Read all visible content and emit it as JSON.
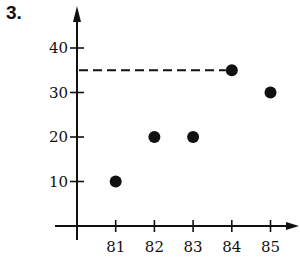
{
  "problem_number": "3.",
  "chart_data": {
    "type": "scatter",
    "title": "",
    "xlabel": "",
    "ylabel": "",
    "x": [
      81,
      82,
      83,
      84,
      85
    ],
    "y": [
      10,
      20,
      20,
      35,
      30
    ],
    "x_ticks": [
      "81",
      "82",
      "83",
      "84",
      "85"
    ],
    "y_ticks": [
      "10",
      "20",
      "30",
      "40"
    ],
    "xlim": [
      80,
      86
    ],
    "ylim": [
      0,
      45
    ],
    "grid": false,
    "legend": null,
    "annotations": [
      {
        "type": "dashed-horizontal-line",
        "y": 35,
        "from_x": "y-axis",
        "to_x": 84
      }
    ],
    "point_color": "#111111",
    "axis_color": "#111111"
  }
}
